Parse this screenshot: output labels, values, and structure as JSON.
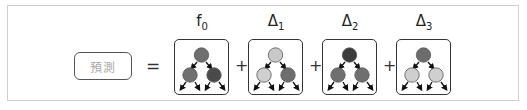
{
  "diagram": {
    "prediction_label": "預測",
    "equals_sign": "=",
    "plus_sign": "+",
    "terms": [
      {
        "label_base": "f",
        "label_sub": "0",
        "x": 174,
        "nodes": {
          "top": "#6f6f6f",
          "left": "#707070",
          "right": "#4a4a4a"
        }
      },
      {
        "label_base": "Δ",
        "label_sub": "1",
        "x": 248,
        "nodes": {
          "top": "#c9c9c9",
          "left": "#cfcfcf",
          "right": "#6e6e6e"
        }
      },
      {
        "label_base": "Δ",
        "label_sub": "2",
        "x": 322,
        "nodes": {
          "top": "#3c3c3c",
          "left": "#6f6f6f",
          "right": "#6f6f6f"
        }
      },
      {
        "label_base": "Δ",
        "label_sub": "3",
        "x": 396,
        "nodes": {
          "top": "#6c6c6c",
          "left": "#cfcfcf",
          "right": "#cfcfcf"
        }
      }
    ],
    "plus_positions": [
      235,
      309,
      383
    ]
  }
}
